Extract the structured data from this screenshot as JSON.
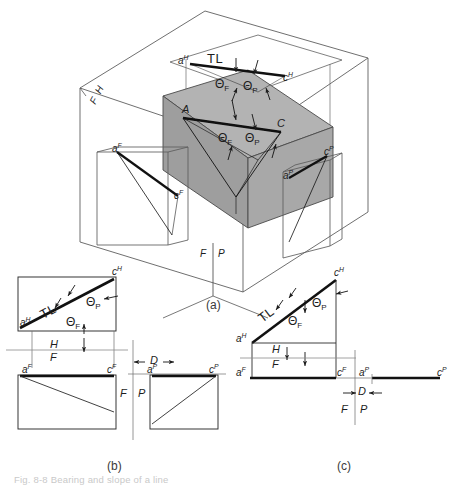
{
  "figure": {
    "title_note": "Fig. 8-8  Bearing and slope of a line",
    "captions": [
      {
        "key": "a",
        "text": "(a)"
      },
      {
        "key": "b",
        "text": "(b)"
      },
      {
        "key": "c",
        "text": "(c)"
      }
    ]
  },
  "pictorial": {
    "name": "glass-box-pictorial",
    "fold_lines": [
      {
        "upper": "H",
        "lower": "F"
      },
      {
        "left": "F",
        "right": "P"
      }
    ],
    "solid_fill": "#a9a9a9",
    "labels": {
      "top_view_point_a": "a",
      "top_view_point_a_sup": "H",
      "top_view_point_c": "c",
      "top_view_point_c_sup": "H",
      "true_length": "TL",
      "theta_f": "Θ",
      "theta_f_sub": "F",
      "theta_p": "Θ",
      "theta_p_sub": "P",
      "solid_point_a": "A",
      "solid_point_c": "C",
      "front_view_point_a": "a",
      "front_view_point_a_sup": "F",
      "front_view_point_c": "c",
      "front_view_point_c_sup": "F",
      "profile_view_point_a": "a",
      "profile_view_point_a_sup": "P",
      "profile_view_point_c": "c",
      "profile_view_point_c_sup": "P",
      "fold_h": "H",
      "fold_f": "F",
      "fold_f2": "F",
      "fold_p": "P"
    }
  },
  "view_b": {
    "name": "orthographic-views-b",
    "labels": {
      "top_a": "a",
      "top_a_sup": "H",
      "top_c": "c",
      "top_c_sup": "H",
      "true_length": "TL",
      "theta_p": "Θ",
      "theta_p_sub": "P",
      "theta_f": "Θ",
      "theta_f_sub": "F",
      "fold_h": "H",
      "fold_f": "F",
      "front_a": "a",
      "front_a_sup": "F",
      "front_c": "c",
      "front_c_sup": "F",
      "dim_d": "D",
      "fold_f2": "F",
      "fold_p": "P",
      "profile_a": "a",
      "profile_a_sup": "P",
      "profile_c": "c",
      "profile_c_sup": "P"
    }
  },
  "view_c": {
    "name": "orthographic-views-c",
    "labels": {
      "top_a": "a",
      "top_a_sup": "H",
      "top_c": "c",
      "top_c_sup": "H",
      "true_length": "TL",
      "theta_p": "Θ",
      "theta_p_sub": "P",
      "theta_f": "Θ",
      "theta_f_sub": "F",
      "fold_h": "H",
      "fold_f": "F",
      "front_a": "a",
      "front_a_sup": "F",
      "front_c": "c",
      "front_c_sup": "F",
      "dim_d": "D",
      "fold_f2": "F",
      "fold_p": "P",
      "profile_a": "a",
      "profile_a_sup": "P",
      "profile_c": "c",
      "profile_c_sup": "P"
    }
  }
}
